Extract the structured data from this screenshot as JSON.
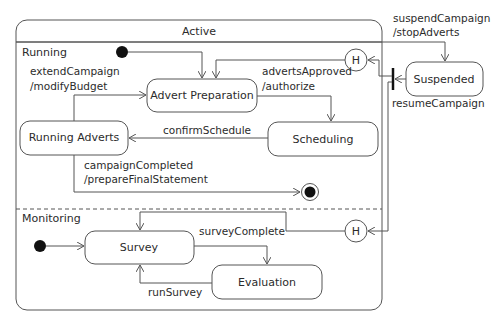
{
  "diagram": {
    "type": "UML state machine",
    "composite_state": {
      "name": "Active",
      "regions": [
        {
          "name": "Running",
          "states": [
            "Advert Preparation",
            "Scheduling",
            "Running Adverts"
          ],
          "history": "H"
        },
        {
          "name": "Monitoring",
          "states": [
            "Survey",
            "Evaluation"
          ],
          "history": "H"
        }
      ]
    },
    "external_states": [
      "Suspended"
    ],
    "transitions": {
      "extend": {
        "line1": "extendCampaign",
        "line2": "/modifyBudget"
      },
      "approved": {
        "line1": "advertsApproved",
        "line2": "/authorize"
      },
      "confirm": "confirmSchedule",
      "completed": {
        "line1": "campaignCompleted",
        "line2": "/prepareFinalStatement"
      },
      "suspend": {
        "line1": "suspendCampaign",
        "line2": "/stopAdverts"
      },
      "resume": "resumeCampaign",
      "surveyComplete": "surveyComplete",
      "runSurvey": "runSurvey"
    },
    "history_label": "H"
  }
}
